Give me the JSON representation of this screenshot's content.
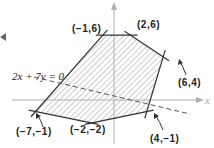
{
  "figure": {
    "type": "feasible-region-diagram",
    "axis_labels": {
      "x": "x"
    },
    "line_label": "2x + 7y = 0",
    "vertices": [
      {
        "label": "(-1, 6)",
        "display": "(−1,6)",
        "x": -1,
        "y": 6
      },
      {
        "label": "(2, 6)",
        "display": "(2,6)",
        "x": 2,
        "y": 6
      },
      {
        "label": "(6, 4)",
        "display": "(6,4)",
        "x": 6,
        "y": 4
      },
      {
        "label": "(4, -1)",
        "display": "(4,−1)",
        "x": 4,
        "y": -1
      },
      {
        "label": "(-2, -2)",
        "display": "(−2,−2)",
        "x": -2,
        "y": -2
      },
      {
        "label": "(-7, -1)",
        "display": "(−7,−1)",
        "x": -7,
        "y": -1
      }
    ],
    "region_fill": "hatched",
    "colors": {
      "edge": "#333333",
      "hatch": "#9a9a9a",
      "axis": "#b0b0b0",
      "dashed_line": "#555555"
    }
  }
}
